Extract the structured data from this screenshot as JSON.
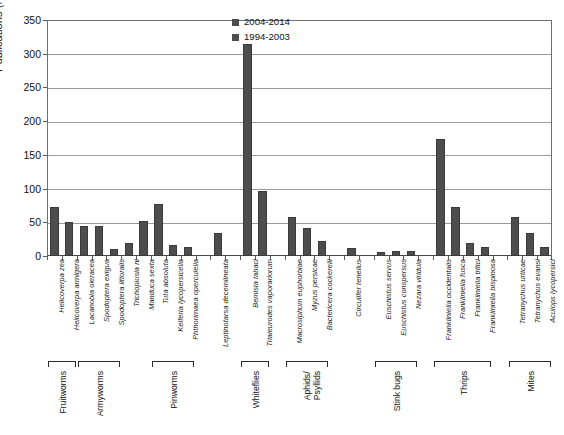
{
  "chart_data": {
    "type": "bar",
    "title": "",
    "xlabel": "",
    "ylabel": "Publications (No.)",
    "ylim": [
      0,
      350
    ],
    "ytick_step": 50,
    "yticks": [
      "0",
      "50",
      "100",
      "150",
      "200",
      "250",
      "300",
      "350"
    ],
    "grid": true,
    "legend_position": "top-right",
    "legend": [
      {
        "label": "2004-2014",
        "color": "#4d4d4d"
      },
      {
        "label": "1994-2003",
        "color": "#4d4d4d"
      }
    ],
    "series": [
      {
        "name": "2004-2014",
        "color": "#4d4d4d",
        "values": [
          73,
          50,
          45,
          45,
          11,
          19,
          52,
          77,
          16,
          14,
          0,
          34,
          0,
          314,
          97,
          0,
          58,
          42,
          22,
          0,
          12,
          0,
          6,
          7,
          7,
          0,
          173,
          72,
          19,
          14,
          0,
          58,
          34,
          13
        ]
      }
    ],
    "categories": [
      "Helicoverpa zea",
      "Helicoverpa armigera",
      "Lacanobia oleracea",
      "Spodoptera exigua",
      "Spodoptera littoralis",
      "Trichoplusia ni",
      "Manduca sexta",
      "Tuta absoluta",
      "Keiferia lycopersicella",
      "Phthorimaea operculella",
      "",
      "Leptinotarsa decemlineata",
      "",
      "Bemisia tabaci",
      "Trialeurodes vaporariorum",
      "",
      "Macrosiphum euphorbiae",
      "Myzus persicae",
      "Bactericera cockerelli",
      "",
      "Circulifer tenellus",
      "",
      "Euschistus servus",
      "Euschistus conspersus",
      "Nezara viridula",
      "",
      "Frankliniella occidentalis",
      "Frankliniella fusca",
      "Frankliniella tritici",
      "Frankliniella bispinosa",
      "",
      "Tetranychus urticae",
      "Tetranychus evansi",
      "Aculops lycopersici"
    ],
    "groups": [
      {
        "label": "Fruitworms",
        "start_index": 0,
        "end_index": 1
      },
      {
        "label": "Armyworms",
        "start_index": 2,
        "end_index": 4
      },
      {
        "label": "Pinworms",
        "start_index": 7,
        "end_index": 9
      },
      {
        "label": "Whiteflies",
        "start_index": 13,
        "end_index": 14
      },
      {
        "label": "Aphids/\nPsyllids",
        "start_index": 16,
        "end_index": 18
      },
      {
        "label": "Stink bugs",
        "start_index": 22,
        "end_index": 24
      },
      {
        "label": "Thrips",
        "start_index": 26,
        "end_index": 29
      },
      {
        "label": "Mites",
        "start_index": 31,
        "end_index": 33
      }
    ]
  }
}
